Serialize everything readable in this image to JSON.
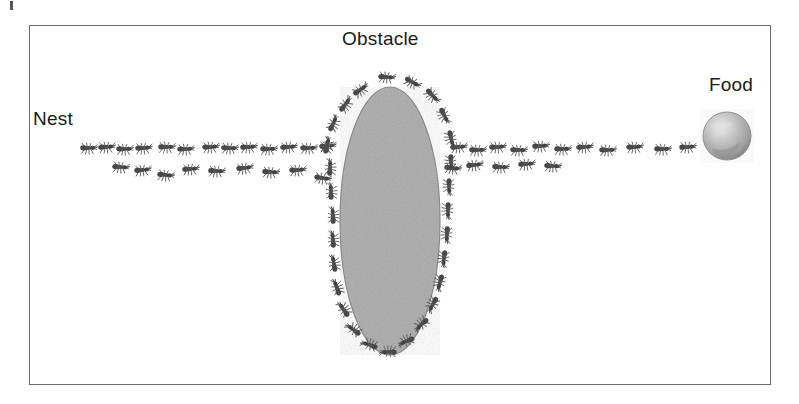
{
  "figure": {
    "type": "diagram",
    "background_color": "#ffffff",
    "frame": {
      "x": 29,
      "y": 25,
      "width": 742,
      "height": 360,
      "border_color": "#6b6b6b",
      "border_width": 1.4
    },
    "labels": {
      "nest": "Nest",
      "obstacle": "Obstacle",
      "food": "Food"
    },
    "label_color": "#1a1a1a",
    "label_font_size": 19
  },
  "obstacle": {
    "shape": "ellipse",
    "cx": 390,
    "cy": 221,
    "rx": 50,
    "ry": 134,
    "fill_color": "#a9a9a9",
    "outline_color": "#8a8a8a",
    "texture": "noise"
  },
  "food": {
    "shape": "sphere",
    "cx": 727,
    "cy": 136,
    "r": 24,
    "fill_color": "#b5b5b5",
    "highlight_color": "#e2e2e2",
    "shadow_color": "#8d8d8d"
  },
  "ants": {
    "color": "#4a4a4a",
    "leg_color": "#6a6a6a",
    "body_length": 15,
    "trail_segments": [
      {
        "name": "nest-to-obstacle-upper",
        "count": 13,
        "points": [
          {
            "x": 88,
            "y": 148,
            "rot": 2
          },
          {
            "x": 106,
            "y": 147,
            "rot": -3
          },
          {
            "x": 124,
            "y": 149,
            "rot": 1
          },
          {
            "x": 143,
            "y": 148,
            "rot": -2
          },
          {
            "x": 166,
            "y": 147,
            "rot": 2
          },
          {
            "x": 185,
            "y": 149,
            "rot": 0
          },
          {
            "x": 210,
            "y": 147,
            "rot": -2
          },
          {
            "x": 229,
            "y": 148,
            "rot": 3
          },
          {
            "x": 248,
            "y": 147,
            "rot": -1
          },
          {
            "x": 268,
            "y": 149,
            "rot": 2
          },
          {
            "x": 288,
            "y": 147,
            "rot": -3
          },
          {
            "x": 308,
            "y": 148,
            "rot": 1
          },
          {
            "x": 327,
            "y": 146,
            "rot": -4
          }
        ]
      },
      {
        "name": "nest-to-obstacle-lower",
        "count": 9,
        "points": [
          {
            "x": 120,
            "y": 167,
            "rot": 6
          },
          {
            "x": 142,
            "y": 170,
            "rot": -4
          },
          {
            "x": 165,
            "y": 175,
            "rot": 8
          },
          {
            "x": 190,
            "y": 169,
            "rot": -3
          },
          {
            "x": 216,
            "y": 171,
            "rot": 4
          },
          {
            "x": 244,
            "y": 168,
            "rot": -6
          },
          {
            "x": 270,
            "y": 172,
            "rot": 5
          },
          {
            "x": 297,
            "y": 170,
            "rot": -2
          },
          {
            "x": 322,
            "y": 178,
            "rot": 10
          }
        ]
      },
      {
        "name": "obstacle-to-food-upper",
        "count": 11,
        "points": [
          {
            "x": 458,
            "y": 147,
            "rot": -3
          },
          {
            "x": 477,
            "y": 150,
            "rot": 2
          },
          {
            "x": 497,
            "y": 147,
            "rot": -2
          },
          {
            "x": 518,
            "y": 150,
            "rot": 3
          },
          {
            "x": 540,
            "y": 146,
            "rot": -1
          },
          {
            "x": 562,
            "y": 149,
            "rot": 2
          },
          {
            "x": 584,
            "y": 147,
            "rot": -3
          },
          {
            "x": 607,
            "y": 150,
            "rot": 1
          },
          {
            "x": 634,
            "y": 147,
            "rot": -2
          },
          {
            "x": 662,
            "y": 149,
            "rot": 2
          },
          {
            "x": 687,
            "y": 147,
            "rot": -1
          }
        ]
      },
      {
        "name": "obstacle-to-food-lower",
        "count": 5,
        "points": [
          {
            "x": 452,
            "y": 168,
            "rot": 7
          },
          {
            "x": 474,
            "y": 165,
            "rot": -5
          },
          {
            "x": 500,
            "y": 167,
            "rot": 4
          },
          {
            "x": 526,
            "y": 164,
            "rot": -3
          },
          {
            "x": 552,
            "y": 166,
            "rot": 5
          }
        ]
      },
      {
        "name": "obstacle-perimeter-left",
        "count": 14,
        "points": [
          {
            "x": 345,
            "y": 105,
            "rot": -52
          },
          {
            "x": 333,
            "y": 124,
            "rot": -64
          },
          {
            "x": 327,
            "y": 146,
            "rot": -76
          },
          {
            "x": 330,
            "y": 168,
            "rot": -86
          },
          {
            "x": 331,
            "y": 192,
            "rot": -90
          },
          {
            "x": 333,
            "y": 216,
            "rot": -92
          },
          {
            "x": 333,
            "y": 240,
            "rot": -94
          },
          {
            "x": 334,
            "y": 264,
            "rot": -98
          },
          {
            "x": 337,
            "y": 288,
            "rot": -108
          },
          {
            "x": 344,
            "y": 310,
            "rot": -124
          },
          {
            "x": 354,
            "y": 330,
            "rot": -142
          },
          {
            "x": 370,
            "y": 345,
            "rot": -160
          },
          {
            "x": 389,
            "y": 352,
            "rot": -178
          },
          {
            "x": 360,
            "y": 90,
            "rot": -34
          }
        ]
      },
      {
        "name": "obstacle-perimeter-right",
        "count": 14,
        "points": [
          {
            "x": 412,
            "y": 82,
            "rot": 30
          },
          {
            "x": 432,
            "y": 95,
            "rot": 48
          },
          {
            "x": 444,
            "y": 115,
            "rot": 64
          },
          {
            "x": 451,
            "y": 138,
            "rot": 78
          },
          {
            "x": 451,
            "y": 162,
            "rot": 88
          },
          {
            "x": 449,
            "y": 186,
            "rot": 90
          },
          {
            "x": 448,
            "y": 210,
            "rot": 92
          },
          {
            "x": 447,
            "y": 234,
            "rot": 94
          },
          {
            "x": 444,
            "y": 258,
            "rot": 98
          },
          {
            "x": 440,
            "y": 282,
            "rot": 106
          },
          {
            "x": 433,
            "y": 304,
            "rot": 120
          },
          {
            "x": 422,
            "y": 324,
            "rot": 138
          },
          {
            "x": 407,
            "y": 341,
            "rot": 158
          },
          {
            "x": 386,
            "y": 77,
            "rot": 6
          }
        ]
      }
    ]
  }
}
